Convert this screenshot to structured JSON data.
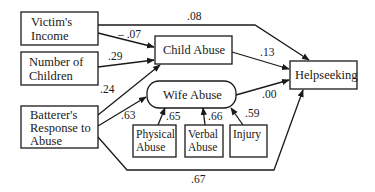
{
  "diagram": {
    "type": "path-model",
    "nodes": {
      "victims_income": [
        "Victim's",
        "Income"
      ],
      "number_of_children": [
        "Number of",
        "Children"
      ],
      "batterers_response": [
        "Batterer's",
        "Response to",
        "Abuse"
      ],
      "child_abuse": [
        "Child Abuse"
      ],
      "wife_abuse": [
        "Wife Abuse"
      ],
      "physical_abuse": [
        "Physical",
        "Abuse"
      ],
      "verbal_abuse": [
        "Verbal",
        "Abuse"
      ],
      "injury": [
        "Injury"
      ],
      "helpseeking": [
        "Helpseeking"
      ]
    },
    "edges": [
      {
        "from": "victims_income",
        "to": "helpseeking",
        "coef": ".08"
      },
      {
        "from": "victims_income",
        "to": "child_abuse",
        "coef": "– .07"
      },
      {
        "from": "number_of_children",
        "to": "child_abuse",
        "coef": ".29"
      },
      {
        "from": "batterers_response",
        "to": "child_abuse",
        "coef": ".24"
      },
      {
        "from": "batterers_response",
        "to": "wife_abuse",
        "coef": ".63"
      },
      {
        "from": "physical_abuse",
        "to": "wife_abuse",
        "coef": ".65"
      },
      {
        "from": "verbal_abuse",
        "to": "wife_abuse",
        "coef": ".66"
      },
      {
        "from": "injury",
        "to": "wife_abuse",
        "coef": ".59"
      },
      {
        "from": "child_abuse",
        "to": "helpseeking",
        "coef": ".13"
      },
      {
        "from": "wife_abuse",
        "to": "helpseeking",
        "coef": ".00"
      },
      {
        "from": "batterers_response",
        "to": "helpseeking",
        "coef": ".67"
      }
    ]
  }
}
